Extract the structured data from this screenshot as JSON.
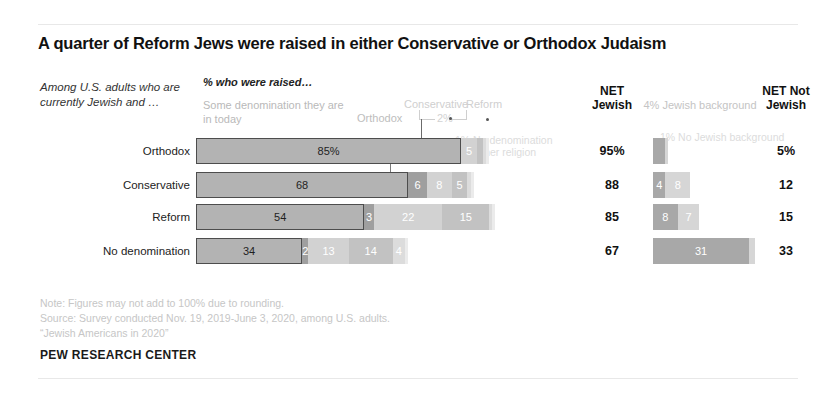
{
  "title": "A quarter of Reform Jews were raised in either Conservative or Orthodox Judaism",
  "lead_in": "Among U.S. adults who are currently Jewish and …",
  "headers": {
    "raised": "% who were raised…",
    "some_denomination": "Some denomination they are in today",
    "orthodox": "Orthodox",
    "conservative": "Conservative",
    "reform": "Reform",
    "callout_2pct": "2%",
    "net_jewish": "NET Jewish",
    "net_not_jewish": "NET Not Jewish",
    "jewish_background": "4% Jewish background"
  },
  "annotations": {
    "no_denomination": "1% No denomination",
    "other_religion": "1% Other religion",
    "no_jewish_background": "1% No Jewish background"
  },
  "notes": [
    "Note: Figures may not add to 100% due to rounding.",
    "Source: Survey conducted Nov. 19, 2019-June 3, 2020, among U.S. adults.",
    "“Jewish Americans in 2020”"
  ],
  "brand": "PEW RESEARCH CENTER",
  "chart_data": {
    "type": "bar",
    "title": "A quarter of Reform Jews were raised in either Conservative or Orthodox Judaism",
    "subtitle": "% who were raised…",
    "orientation": "horizontal",
    "stacked": true,
    "xlabel": "",
    "ylabel": "",
    "xlim": [
      0,
      100
    ],
    "grid": false,
    "legend_position": "top",
    "categories": [
      "Orthodox",
      "Conservative",
      "Reform",
      "No denomination"
    ],
    "series": [
      {
        "name": "Some denomination they are in today",
        "values": [
          85,
          68,
          54,
          34
        ]
      },
      {
        "name": "Orthodox",
        "values": [
          0,
          6,
          3,
          2
        ]
      },
      {
        "name": "Conservative",
        "values": [
          5,
          8,
          22,
          13
        ]
      },
      {
        "name": "Reform",
        "values": [
          2,
          5,
          15,
          14
        ]
      },
      {
        "name": "No denomination",
        "values": [
          1,
          1,
          1,
          4
        ]
      },
      {
        "name": "Other religion",
        "values": [
          1,
          1,
          1,
          1
        ]
      }
    ],
    "net_jewish": [
      95,
      88,
      85,
      67
    ],
    "net_not_jewish": [
      5,
      12,
      15,
      33
    ],
    "net_jewish_labels": [
      "95%",
      "88",
      "85",
      "67"
    ],
    "net_not_jewish_labels": [
      "5%",
      "12",
      "15",
      "33"
    ],
    "not_jewish_breakdown": {
      "series": [
        {
          "name": "Jewish background",
          "values": [
            4,
            4,
            8,
            31
          ]
        },
        {
          "name": "No Jewish background",
          "values": [
            1,
            8,
            7,
            2
          ]
        }
      ]
    }
  },
  "rows": [
    {
      "label": "Orthodox",
      "segments": [
        {
          "key": "main",
          "label": "85%",
          "value": 85,
          "show": true
        },
        {
          "key": "orth",
          "label": "",
          "value": 0,
          "show": false
        },
        {
          "key": "cons",
          "label": "5",
          "value": 5,
          "show": true
        },
        {
          "key": "ref",
          "label": "",
          "value": 2,
          "show": false
        },
        {
          "key": "none",
          "label": "",
          "value": 1,
          "show": false
        },
        {
          "key": "other",
          "label": "",
          "value": 1,
          "show": false
        }
      ],
      "net_jewish": "95%",
      "net_not_jewish": "5%",
      "right_segments": [
        {
          "key": "jb",
          "label": "",
          "value": 4,
          "show": false
        },
        {
          "key": "njb",
          "label": "",
          "value": 1,
          "show": false
        }
      ]
    },
    {
      "label": "Conservative",
      "segments": [
        {
          "key": "main",
          "label": "68",
          "value": 68,
          "show": true
        },
        {
          "key": "orth",
          "label": "6",
          "value": 6,
          "show": true
        },
        {
          "key": "cons",
          "label": "8",
          "value": 8,
          "show": true
        },
        {
          "key": "ref",
          "label": "5",
          "value": 5,
          "show": true
        },
        {
          "key": "none",
          "label": "",
          "value": 1,
          "show": false
        },
        {
          "key": "other",
          "label": "",
          "value": 1,
          "show": false
        }
      ],
      "net_jewish": "88",
      "net_not_jewish": "12",
      "right_segments": [
        {
          "key": "jb",
          "label": "4",
          "value": 4,
          "show": true
        },
        {
          "key": "njb",
          "label": "8",
          "value": 8,
          "show": true
        }
      ]
    },
    {
      "label": "Reform",
      "segments": [
        {
          "key": "main",
          "label": "54",
          "value": 54,
          "show": true
        },
        {
          "key": "orth",
          "label": "3",
          "value": 3,
          "show": true
        },
        {
          "key": "cons",
          "label": "22",
          "value": 22,
          "show": true
        },
        {
          "key": "ref",
          "label": "15",
          "value": 15,
          "show": true
        },
        {
          "key": "none",
          "label": "",
          "value": 1,
          "show": false
        },
        {
          "key": "other",
          "label": "",
          "value": 1,
          "show": false
        }
      ],
      "net_jewish": "85",
      "net_not_jewish": "15",
      "right_segments": [
        {
          "key": "jb",
          "label": "8",
          "value": 8,
          "show": true
        },
        {
          "key": "njb",
          "label": "7",
          "value": 7,
          "show": true
        }
      ]
    },
    {
      "label": "No denomination",
      "segments": [
        {
          "key": "main",
          "label": "34",
          "value": 34,
          "show": true
        },
        {
          "key": "orth",
          "label": "2",
          "value": 2,
          "show": true
        },
        {
          "key": "cons",
          "label": "13",
          "value": 13,
          "show": true
        },
        {
          "key": "ref",
          "label": "14",
          "value": 14,
          "show": true
        },
        {
          "key": "none",
          "label": "4",
          "value": 4,
          "show": true
        },
        {
          "key": "other",
          "label": "",
          "value": 1,
          "show": false
        }
      ],
      "net_jewish": "67",
      "net_not_jewish": "33",
      "right_segments": [
        {
          "key": "jb",
          "label": "31",
          "value": 31,
          "show": true
        },
        {
          "key": "njb",
          "label": "",
          "value": 2,
          "show": false
        }
      ]
    }
  ]
}
